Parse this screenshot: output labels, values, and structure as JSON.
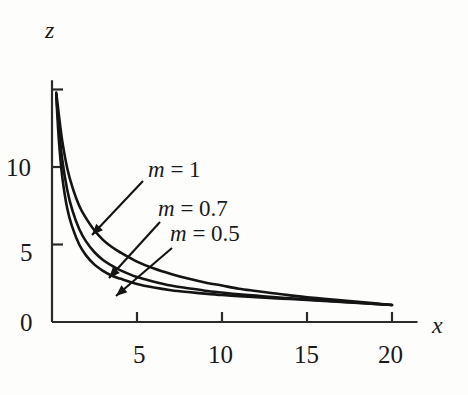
{
  "chart_data": {
    "type": "line",
    "title": "",
    "subtitle": "",
    "xlabel": "x",
    "ylabel": "z",
    "xlim": [
      0,
      21.5
    ],
    "ylim": [
      0,
      15.6
    ],
    "xticks": [
      5,
      10,
      15,
      20
    ],
    "yticks": [
      0,
      5,
      10,
      15
    ],
    "xtick_labels": [
      "5",
      "10",
      "15",
      "20"
    ],
    "ytick_labels": [
      "0",
      "5",
      "10",
      ""
    ],
    "grid": false,
    "legend_position": "inline-annotations",
    "line_color": "#141414",
    "axis_color": "#2b2b2b",
    "background": "#fdfdfc",
    "annotations": [
      {
        "text_math": "m = 1",
        "var": "m",
        "value": "1",
        "x": 4.6,
        "y": 10.5
      },
      {
        "text_math": "m = 0.7",
        "var": "m",
        "value": "0.7",
        "x": 5.6,
        "y": 8.1
      },
      {
        "text_math": "m = 0.5",
        "var": "m",
        "value": "0.5",
        "x": 6.1,
        "y": 6.8
      }
    ],
    "series": [
      {
        "name": "m = 1",
        "m": 1,
        "x": [
          0.25,
          0.4,
          0.6,
          0.9,
          1.2,
          1.6,
          2.0,
          2.5,
          3.0,
          3.5,
          4.0,
          5.0,
          6.0,
          7.0,
          8.0,
          9.0,
          10.0,
          11.0,
          12.0,
          13.0,
          14.0,
          15.0,
          16.0,
          17.0,
          18.0,
          19.0,
          20.0
        ],
        "values": [
          14.8,
          13.4,
          11.7,
          9.9,
          8.7,
          7.5,
          6.7,
          5.9,
          5.3,
          4.85,
          4.5,
          3.9,
          3.45,
          3.1,
          2.8,
          2.55,
          2.35,
          2.15,
          2.0,
          1.85,
          1.72,
          1.6,
          1.5,
          1.4,
          1.3,
          1.2,
          1.1
        ]
      },
      {
        "name": "m = 0.7",
        "m": 0.7,
        "x": [
          0.25,
          0.4,
          0.6,
          0.9,
          1.2,
          1.6,
          2.0,
          2.5,
          3.0,
          3.5,
          4.0,
          5.0,
          6.0,
          7.0,
          8.0,
          9.0,
          10.0,
          11.0,
          12.0,
          13.0,
          14.0,
          15.0,
          16.0,
          17.0,
          18.0,
          19.0,
          20.0
        ],
        "values": [
          14.7,
          12.6,
          10.5,
          8.5,
          7.2,
          6.0,
          5.2,
          4.5,
          4.0,
          3.65,
          3.35,
          2.9,
          2.6,
          2.35,
          2.18,
          2.02,
          1.9,
          1.79,
          1.7,
          1.61,
          1.53,
          1.46,
          1.39,
          1.31,
          1.24,
          1.17,
          1.1
        ]
      },
      {
        "name": "m = 0.5",
        "m": 0.5,
        "x": [
          0.25,
          0.4,
          0.6,
          0.9,
          1.2,
          1.6,
          2.0,
          2.5,
          3.0,
          3.5,
          4.0,
          5.0,
          6.0,
          7.0,
          8.0,
          9.0,
          10.0,
          11.0,
          12.0,
          13.0,
          14.0,
          15.0,
          16.0,
          17.0,
          18.0,
          19.0,
          20.0
        ],
        "values": [
          14.6,
          11.8,
          9.4,
          7.3,
          6.1,
          5.0,
          4.3,
          3.7,
          3.3,
          3.0,
          2.8,
          2.45,
          2.22,
          2.05,
          1.93,
          1.83,
          1.74,
          1.67,
          1.6,
          1.54,
          1.48,
          1.42,
          1.36,
          1.29,
          1.23,
          1.16,
          1.1
        ]
      }
    ]
  },
  "axes": {
    "y_name": "z",
    "x_name": "x"
  }
}
